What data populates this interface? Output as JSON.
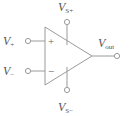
{
  "figure": {
    "line_color": "#9a9a9a",
    "label_color": "#555555",
    "background_color": "#ffffff"
  },
  "labels": {
    "non_inverting_input": {
      "symbol": "V",
      "subscript": "+"
    },
    "inverting_input": {
      "symbol": "V",
      "subscript": "−"
    },
    "positive_supply": {
      "symbol": "V",
      "subscript": "S+"
    },
    "negative_supply": {
      "symbol": "V",
      "subscript": "S−"
    },
    "output": {
      "symbol": "V",
      "subscript": "out"
    }
  },
  "terminal_signs": {
    "non_inverting": "+",
    "inverting": "−"
  },
  "terminals": [
    {
      "name": "non-inverting-input-terminal",
      "x": 28,
      "y": 41
    },
    {
      "name": "inverting-input-terminal",
      "x": 28,
      "y": 71
    },
    {
      "name": "positive-supply-terminal",
      "x": 67,
      "y": 22
    },
    {
      "name": "negative-supply-terminal",
      "x": 67,
      "y": 90
    },
    {
      "name": "output-terminal",
      "x": 117,
      "y": 56
    }
  ],
  "amplifier_body": {
    "shape": "triangle",
    "left_edge_x": 45,
    "top_y": 27,
    "bottom_y": 85,
    "apex_x": 92,
    "apex_y": 56
  }
}
